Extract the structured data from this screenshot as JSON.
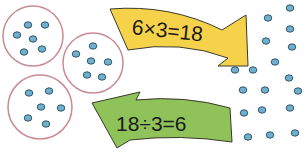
{
  "colors": {
    "circle_stroke": "#c98a93",
    "dot_fill": "#6fb0cf",
    "dot_stroke": "#2a4a5a",
    "multiply_arrow_fill": "#f6d24a",
    "divide_arrow_fill": "#8fc35a",
    "arrow_stroke": "#3a3a2a"
  },
  "groups": {
    "count": 3,
    "dots_per_group": 6
  },
  "total_dots": 18,
  "multiply_arrow": {
    "label": "6×3=18",
    "direction": "right"
  },
  "divide_arrow": {
    "label": "18÷3=6",
    "direction": "left"
  }
}
